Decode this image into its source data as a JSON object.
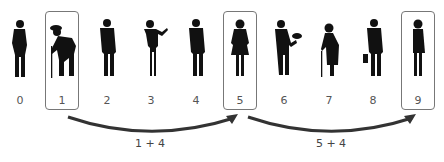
{
  "people": [
    {
      "index": "0",
      "figure": "man-standing-side",
      "highlighted": false
    },
    {
      "index": "1",
      "figure": "old-man-with-cane-hunched",
      "highlighted": true
    },
    {
      "index": "2",
      "figure": "man-in-suit",
      "highlighted": false
    },
    {
      "index": "3",
      "figure": "woman-gesturing",
      "highlighted": false
    },
    {
      "index": "4",
      "figure": "man-in-suit",
      "highlighted": false
    },
    {
      "index": "5",
      "figure": "woman-in-dress",
      "highlighted": true
    },
    {
      "index": "6",
      "figure": "man-holding-plate",
      "highlighted": false
    },
    {
      "index": "7",
      "figure": "old-woman-with-cane",
      "highlighted": false
    },
    {
      "index": "8",
      "figure": "man-with-briefcase",
      "highlighted": false
    },
    {
      "index": "9",
      "figure": "woman-in-business-suit",
      "highlighted": true
    }
  ],
  "jumps": [
    {
      "from": "1",
      "to": "5",
      "label": "1 + 4"
    },
    {
      "from": "5",
      "to": "9",
      "label": "5 + 4"
    }
  ],
  "colors": {
    "figure": "#111111",
    "box": "#777777",
    "arrow": "#333333"
  }
}
